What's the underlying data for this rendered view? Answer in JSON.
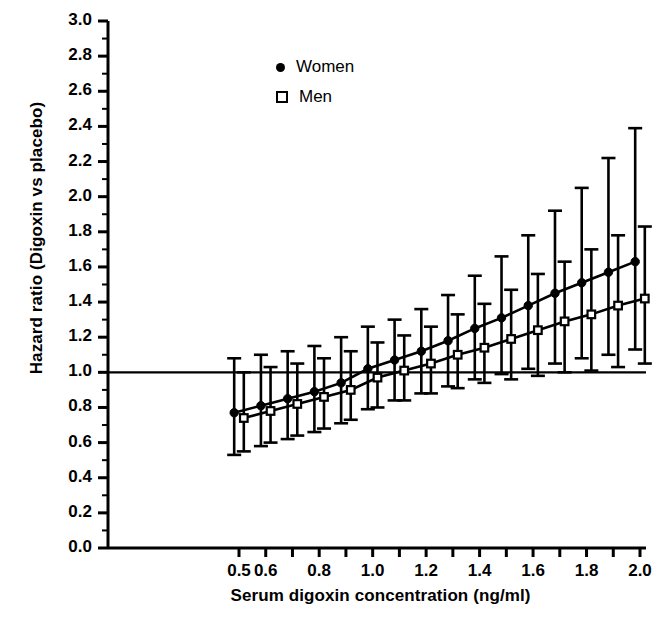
{
  "chart_data": {
    "type": "line",
    "title": "",
    "xlabel": "Serum digoxin concentration (ng/ml)",
    "ylabel": "Hazard ratio (Digoxin vs placebo)",
    "xlim": [
      0.32,
      2.06
    ],
    "ylim": [
      0.0,
      3.0
    ],
    "grid": false,
    "legend_position": "top-center",
    "reference_line": {
      "y": 1.0,
      "label": "1.0"
    },
    "ytick_labels": [
      "0.0",
      "0.2",
      "0.4",
      "0.6",
      "0.8",
      "1.0",
      "1.2",
      "1.4",
      "1.6",
      "1.8",
      "2.0",
      "2.2",
      "2.4",
      "2.6",
      "2.8",
      "3.0"
    ],
    "ytick_values": [
      0.0,
      0.2,
      0.4,
      0.6,
      0.8,
      1.0,
      1.2,
      1.4,
      1.6,
      1.8,
      2.0,
      2.2,
      2.4,
      2.6,
      2.8,
      3.0
    ],
    "yminor_step": 0.1,
    "xtick_values": [
      0.5,
      0.6,
      0.7,
      0.8,
      0.9,
      1.0,
      1.1,
      1.2,
      1.3,
      1.4,
      1.5,
      1.6,
      1.7,
      1.8,
      1.9,
      2.0
    ],
    "xtick_labels": [
      "0.5",
      "0.6",
      "",
      "0.8",
      "",
      "1.0",
      "",
      "1.2",
      "",
      "1.4",
      "",
      "1.6",
      "",
      "1.8",
      "",
      "2.0"
    ],
    "x": [
      0.5,
      0.6,
      0.7,
      0.8,
      0.9,
      1.0,
      1.1,
      1.2,
      1.3,
      1.4,
      1.5,
      1.6,
      1.7,
      1.8,
      1.9,
      2.0
    ],
    "series": [
      {
        "name": "Women",
        "marker": "filled-circle",
        "color": "#000000",
        "x_offset": -0.018,
        "values": [
          0.77,
          0.81,
          0.85,
          0.89,
          0.94,
          1.02,
          1.07,
          1.12,
          1.18,
          1.25,
          1.31,
          1.38,
          1.45,
          1.51,
          1.57,
          1.63
        ],
        "ci_low": [
          0.53,
          0.58,
          0.62,
          0.66,
          0.71,
          0.79,
          0.84,
          0.88,
          0.92,
          0.96,
          0.99,
          1.02,
          1.05,
          1.08,
          1.1,
          1.13
        ],
        "ci_high": [
          1.08,
          1.1,
          1.12,
          1.15,
          1.2,
          1.26,
          1.3,
          1.36,
          1.44,
          1.55,
          1.66,
          1.78,
          1.92,
          2.05,
          2.22,
          2.39
        ]
      },
      {
        "name": "Men",
        "marker": "open-square",
        "color": "#000000",
        "x_offset": 0.018,
        "values": [
          0.74,
          0.78,
          0.82,
          0.86,
          0.9,
          0.97,
          1.01,
          1.05,
          1.1,
          1.14,
          1.19,
          1.24,
          1.29,
          1.33,
          1.38,
          1.42
        ],
        "ci_low": [
          0.55,
          0.6,
          0.64,
          0.68,
          0.73,
          0.8,
          0.84,
          0.88,
          0.91,
          0.94,
          0.96,
          0.98,
          1.0,
          1.01,
          1.03,
          1.05
        ],
        "ci_high": [
          1.0,
          1.03,
          1.05,
          1.08,
          1.12,
          1.17,
          1.21,
          1.26,
          1.33,
          1.39,
          1.47,
          1.56,
          1.63,
          1.7,
          1.78,
          1.83
        ]
      }
    ]
  },
  "legend": {
    "items": [
      {
        "label": "Women",
        "marker": "filled-circle"
      },
      {
        "label": "Men",
        "marker": "open-square"
      }
    ]
  },
  "axes": {
    "x_title": "Serum digoxin concentration (ng/ml)",
    "y_title": "Hazard ratio (Digoxin vs placebo)"
  }
}
